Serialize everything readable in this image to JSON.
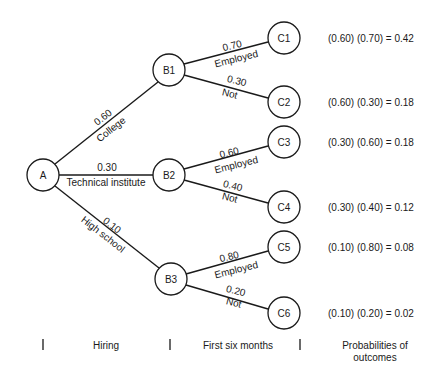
{
  "nodes": {
    "A": "A",
    "B1": "B1",
    "B2": "B2",
    "B3": "B3",
    "C1": "C1",
    "C2": "C2",
    "C3": "C3",
    "C4": "C4",
    "C5": "C5",
    "C6": "C6"
  },
  "hiring_branches": [
    {
      "prob": "0.60",
      "label": "College",
      "to": "B1"
    },
    {
      "prob": "0.30",
      "label": "Technical institute",
      "to": "B2"
    },
    {
      "prob": "0.10",
      "label": "High school",
      "to": "B3"
    }
  ],
  "outcome_branches": [
    {
      "from": "B1",
      "to": "C1",
      "prob": "0.70",
      "label": "Employed"
    },
    {
      "from": "B1",
      "to": "C2",
      "prob": "0.30",
      "label": "Not"
    },
    {
      "from": "B2",
      "to": "C3",
      "prob": "0.60",
      "label": "Employed"
    },
    {
      "from": "B2",
      "to": "C4",
      "prob": "0.40",
      "label": "Not"
    },
    {
      "from": "B3",
      "to": "C5",
      "prob": "0.80",
      "label": "Employed"
    },
    {
      "from": "B3",
      "to": "C6",
      "prob": "0.20",
      "label": "Not"
    }
  ],
  "outcome_probabilities": [
    "(0.60)  (0.70) = 0.42",
    "(0.60)  (0.30) = 0.18",
    "(0.30)  (0.60) = 0.18",
    "(0.30)  (0.40) = 0.12",
    "(0.10)  (0.80) = 0.08",
    "(0.10)  (0.20) = 0.02"
  ],
  "footer": {
    "stage1": "Hiring",
    "stage2": "First six months",
    "stage3_line1": "Probabilities of",
    "stage3_line2": "outcomes"
  }
}
